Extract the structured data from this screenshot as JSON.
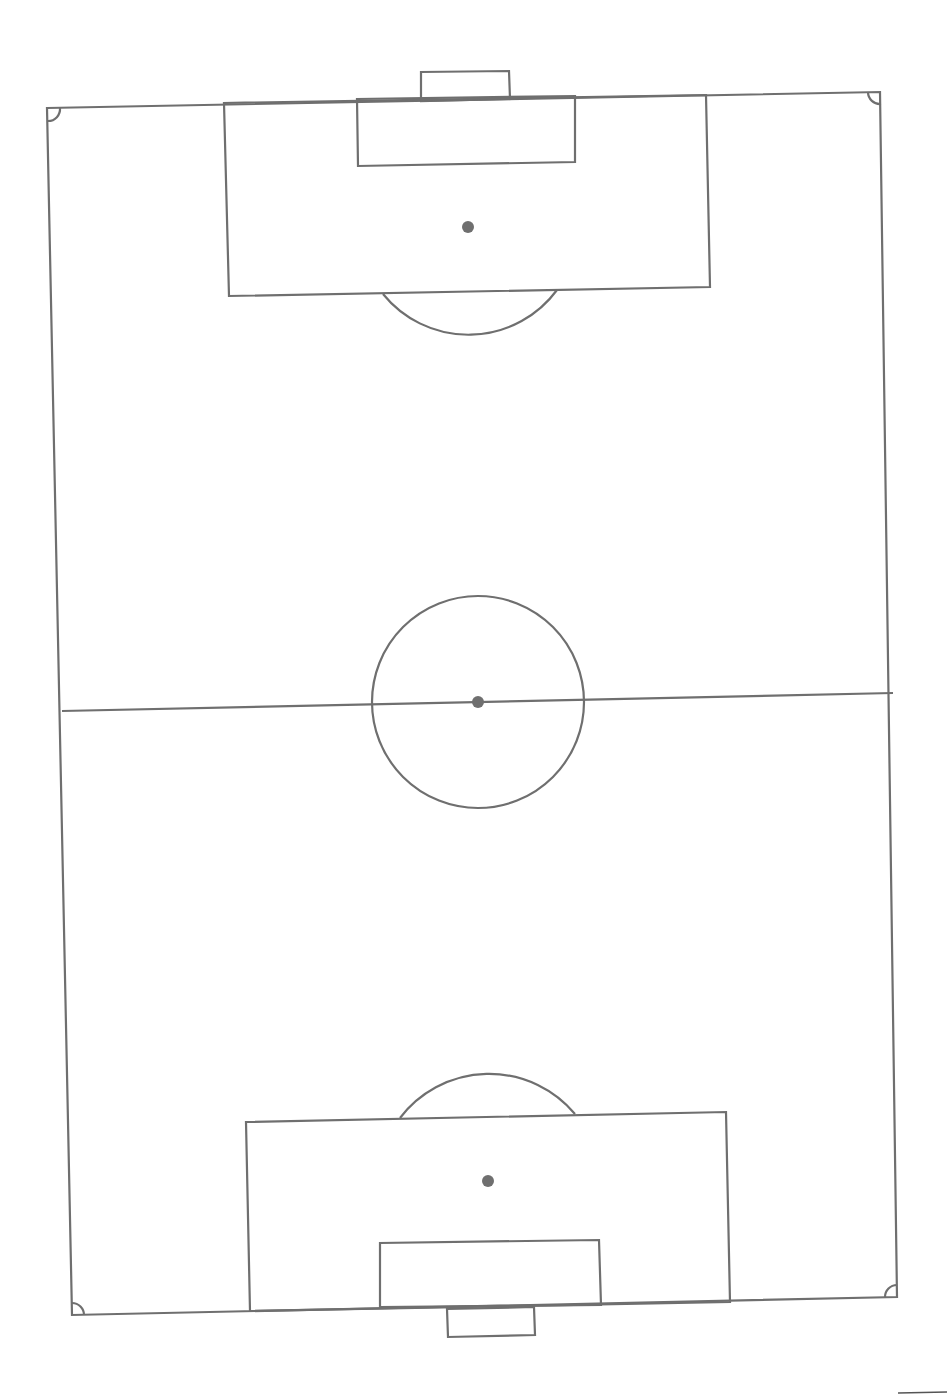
{
  "diagram": {
    "type": "soccer-pitch",
    "orientation": "vertical",
    "line_color": "#6f6f6f",
    "background": "#ffffff",
    "boundary": {
      "points": [
        [
          47,
          108
        ],
        [
          880,
          92
        ],
        [
          897,
          1297
        ],
        [
          72,
          1315
        ]
      ]
    },
    "halfway_line": {
      "x1": 62,
      "y1": 711,
      "x2": 893,
      "y2": 693
    },
    "center_circle": {
      "cx": 478,
      "cy": 702,
      "r": 106
    },
    "center_spot": {
      "cx": 478,
      "cy": 702,
      "r": 6
    },
    "top_goal": {
      "points": [
        [
          421,
          101
        ],
        [
          421,
          72
        ],
        [
          509,
          71
        ],
        [
          510,
          99
        ]
      ]
    },
    "top_goal_area": {
      "points": [
        [
          357,
          99
        ],
        [
          358,
          166
        ],
        [
          575,
          162
        ],
        [
          575,
          96
        ]
      ]
    },
    "top_penalty_area": {
      "points": [
        [
          224,
          103
        ],
        [
          229,
          296
        ],
        [
          710,
          287
        ],
        [
          706,
          95
        ]
      ]
    },
    "top_penalty_spot": {
      "cx": 468,
      "cy": 227,
      "r": 6
    },
    "top_penalty_arc": {
      "d": "M383,294 A110,110 0 0 0 557,290"
    },
    "bottom_goal": {
      "points": [
        [
          447,
          1309
        ],
        [
          448,
          1337
        ],
        [
          535,
          1335
        ],
        [
          534,
          1307
        ]
      ]
    },
    "bottom_goal_area": {
      "points": [
        [
          380,
          1307
        ],
        [
          380,
          1243
        ],
        [
          599,
          1240
        ],
        [
          601,
          1305
        ]
      ]
    },
    "bottom_penalty_area": {
      "points": [
        [
          250,
          1311
        ],
        [
          246,
          1122
        ],
        [
          726,
          1112
        ],
        [
          730,
          1302
        ]
      ]
    },
    "bottom_penalty_spot": {
      "cx": 488,
      "cy": 1181,
      "r": 6
    },
    "bottom_penalty_arc": {
      "d": "M400,1118 A112,112 0 0 1 575,1114"
    },
    "corner_arcs": [
      {
        "d": "M48,121 A12,12 0 0 0 60,108"
      },
      {
        "d": "M868,92 A12,12 0 0 0 881,104"
      },
      {
        "d": "M897,1285 A12,12 0 0 0 885,1297"
      },
      {
        "d": "M84,1315 A12,12 0 0 0 72,1303"
      }
    ],
    "scan_artifact_line": {
      "x1": 898,
      "y1": 1393,
      "x2": 947,
      "y2": 1392
    }
  }
}
